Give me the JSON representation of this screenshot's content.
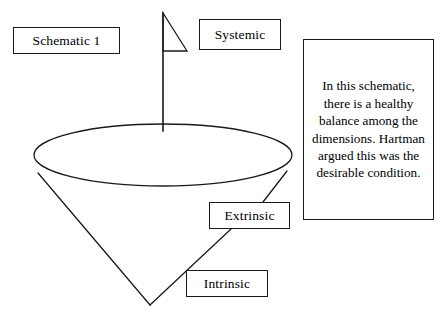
{
  "figure": {
    "title_box": "Schematic 1",
    "caption": "In this schematic, there is a healthy balance among the dimensions. Hartman argued this was the desirable condition."
  },
  "labels": {
    "systemic": "Systemic",
    "extrinsic": "Extrinsic",
    "intrinsic": "Intrinsic"
  },
  "colors": {
    "stroke": "#1a1a1a",
    "background": "#ffffff",
    "text": "#000000"
  },
  "diagram": {
    "type": "inverted-cone-schematic",
    "shapes": [
      {
        "name": "cone-rim-ellipse",
        "kind": "ellipse",
        "cx": 163,
        "cy": 155,
        "rx": 129,
        "ry": 31
      },
      {
        "name": "cone-left-side",
        "kind": "line",
        "x1": 38,
        "y1": 173,
        "x2": 150,
        "y2": 305
      },
      {
        "name": "cone-right-side",
        "kind": "line",
        "x1": 287,
        "y1": 171,
        "x2": 263,
        "y2": 202
      },
      {
        "name": "cone-right-lower-side",
        "kind": "line",
        "x1": 231,
        "y1": 229,
        "x2": 150,
        "y2": 305
      },
      {
        "name": "flag-pole",
        "kind": "line",
        "x1": 163,
        "y1": 13,
        "x2": 163,
        "y2": 131
      },
      {
        "name": "flag-banner",
        "kind": "triangle",
        "points": "163,13 187,51 163,51"
      }
    ]
  }
}
